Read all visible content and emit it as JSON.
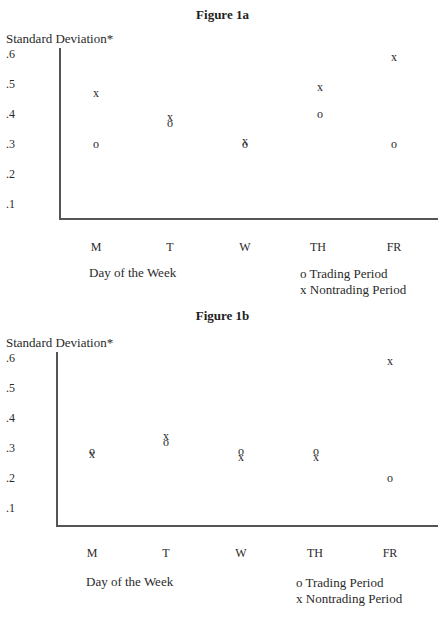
{
  "chart_data": [
    {
      "type": "scatter",
      "title": "Figure 1a",
      "ylabel": "Standard Deviation*",
      "xlabel": "Day of the Week",
      "categories": [
        "M",
        "T",
        "W",
        "TH",
        "FR"
      ],
      "yticks": [
        ".6",
        ".5",
        ".4",
        ".3",
        ".2",
        ".1"
      ],
      "ylim": [
        0.05,
        0.62
      ],
      "grid": false,
      "legend_position": "bottom-right",
      "series": [
        {
          "name": "Trading Period",
          "marker": "o",
          "values": [
            0.3,
            0.37,
            0.3,
            0.4,
            0.3
          ]
        },
        {
          "name": "Nontrading Period",
          "marker": "x",
          "values": [
            0.47,
            0.39,
            0.31,
            0.49,
            0.59
          ]
        }
      ]
    },
    {
      "type": "scatter",
      "title": "Figure 1b",
      "ylabel": "Standard Deviation*",
      "xlabel": "Day of the Week",
      "categories": [
        "M",
        "T",
        "W",
        "TH",
        "FR"
      ],
      "yticks": [
        ".6",
        ".5",
        ".4",
        ".3",
        ".2",
        ".1"
      ],
      "ylim": [
        0.05,
        0.62
      ],
      "grid": false,
      "legend_position": "bottom-right",
      "series": [
        {
          "name": "Trading Period",
          "marker": "o",
          "values": [
            0.29,
            0.32,
            0.29,
            0.29,
            0.2
          ]
        },
        {
          "name": "Nontrading Period",
          "marker": "x",
          "values": [
            0.28,
            0.34,
            0.27,
            0.27,
            0.59
          ]
        }
      ]
    }
  ],
  "figures": [
    {
      "title": "Figure 1a",
      "ylabel": "Standard Deviation*",
      "xlabel": "Day of the Week",
      "legend": {
        "trading": "o Trading Period",
        "nontrading": "x Nontrading Period"
      }
    },
    {
      "title": "Figure 1b",
      "ylabel": "Standard Deviation*",
      "xlabel": "Day of the Week",
      "legend": {
        "trading": "o Trading Period",
        "nontrading": "x Nontrading Period"
      }
    }
  ],
  "marker_symbols": {
    "trading": "o",
    "nontrading": "x"
  }
}
